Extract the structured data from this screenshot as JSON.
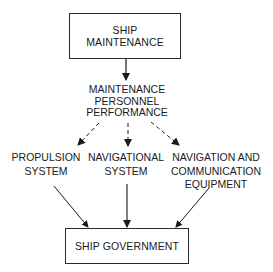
{
  "diagram": {
    "type": "flowchart",
    "nodes": {
      "ship_maintenance": {
        "lines": [
          "SHIP",
          "MAINTENANCE"
        ],
        "shape": "box"
      },
      "personnel_performance": {
        "lines": [
          "MAINTENANCE",
          "PERSONNEL",
          "PERFORMANCE"
        ],
        "shape": "text"
      },
      "propulsion_system": {
        "lines": [
          "PROPULSION",
          "SYSTEM"
        ],
        "shape": "text"
      },
      "navigational_system": {
        "lines": [
          "NAVIGATIONAL",
          "SYSTEM"
        ],
        "shape": "text"
      },
      "nav_comm_equipment": {
        "lines": [
          "NAVIGATION AND",
          "COMMUNICATION",
          "EQUIPMENT"
        ],
        "shape": "text"
      },
      "ship_government": {
        "lines": [
          "SHIP GOVERNMENT"
        ],
        "shape": "box"
      }
    },
    "edges": [
      {
        "from": "ship_maintenance",
        "to": "personnel_performance",
        "style": "solid"
      },
      {
        "from": "personnel_performance",
        "to": "propulsion_system",
        "style": "dashed"
      },
      {
        "from": "personnel_performance",
        "to": "navigational_system",
        "style": "dashed"
      },
      {
        "from": "personnel_performance",
        "to": "nav_comm_equipment",
        "style": "dashed"
      },
      {
        "from": "propulsion_system",
        "to": "ship_government",
        "style": "solid"
      },
      {
        "from": "navigational_system",
        "to": "ship_government",
        "style": "solid"
      },
      {
        "from": "nav_comm_equipment",
        "to": "ship_government",
        "style": "solid"
      }
    ],
    "colors": {
      "stroke": "#2a2a2a",
      "text": "#1a1a1a",
      "background": "#ffffff"
    }
  }
}
